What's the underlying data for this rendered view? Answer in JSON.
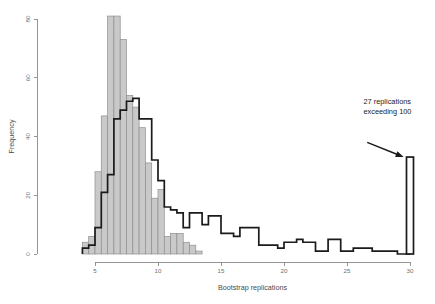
{
  "chart_data": {
    "type": "bar",
    "title": "",
    "xlabel": "Bootstrap replications",
    "ylabel": "Frequency",
    "xlim": [
      3.2,
      30.8
    ],
    "ylim": [
      0,
      84
    ],
    "xticks": [
      5,
      10,
      15,
      20,
      25,
      30
    ],
    "xtick_labels": [
      "5",
      "10",
      "15",
      "20",
      "25",
      "30"
    ],
    "yticks": [
      0,
      20,
      40,
      60,
      80
    ],
    "ytick_labels": [
      "0",
      "20",
      "40",
      "60",
      "80"
    ],
    "grid": false,
    "legend": "none",
    "bin_width": 0.5,
    "series": [
      {
        "name": "gray-histogram",
        "style": "filled-bars",
        "fill_color": "#c9c9c9",
        "edge_color": "#8f8f8f",
        "bins": [
          {
            "x": 4.0,
            "value": 4
          },
          {
            "x": 4.5,
            "value": 6
          },
          {
            "x": 5.0,
            "value": 28
          },
          {
            "x": 5.5,
            "value": 47
          },
          {
            "x": 6.0,
            "value": 81
          },
          {
            "x": 6.5,
            "value": 81
          },
          {
            "x": 7.0,
            "value": 73
          },
          {
            "x": 7.5,
            "value": 54
          },
          {
            "x": 8.0,
            "value": 50
          },
          {
            "x": 8.5,
            "value": 43
          },
          {
            "x": 9.0,
            "value": 31
          },
          {
            "x": 9.5,
            "value": 19
          },
          {
            "x": 10.0,
            "value": 22
          },
          {
            "x": 10.5,
            "value": 6
          },
          {
            "x": 11.0,
            "value": 7
          },
          {
            "x": 11.5,
            "value": 7
          },
          {
            "x": 12.0,
            "value": 4
          },
          {
            "x": 12.5,
            "value": 3
          },
          {
            "x": 13.0,
            "value": 1
          }
        ]
      },
      {
        "name": "outline-histogram",
        "style": "step-outline",
        "edge_color": "#1b1b1b",
        "bins": [
          {
            "x": 4.0,
            "value": 2
          },
          {
            "x": 4.5,
            "value": 3
          },
          {
            "x": 5.0,
            "value": 9
          },
          {
            "x": 5.5,
            "value": 21
          },
          {
            "x": 6.0,
            "value": 27
          },
          {
            "x": 6.5,
            "value": 46
          },
          {
            "x": 7.0,
            "value": 49
          },
          {
            "x": 7.5,
            "value": 52
          },
          {
            "x": 8.0,
            "value": 53
          },
          {
            "x": 8.5,
            "value": 46
          },
          {
            "x": 9.0,
            "value": 46
          },
          {
            "x": 9.5,
            "value": 32
          },
          {
            "x": 10.0,
            "value": 25
          },
          {
            "x": 10.5,
            "value": 16
          },
          {
            "x": 11.0,
            "value": 15
          },
          {
            "x": 11.5,
            "value": 14
          },
          {
            "x": 12.0,
            "value": 9
          },
          {
            "x": 12.5,
            "value": 14
          },
          {
            "x": 13.0,
            "value": 14
          },
          {
            "x": 13.5,
            "value": 10
          },
          {
            "x": 14.0,
            "value": 13
          },
          {
            "x": 14.5,
            "value": 13
          },
          {
            "x": 15.0,
            "value": 7
          },
          {
            "x": 15.5,
            "value": 7
          },
          {
            "x": 16.0,
            "value": 6
          },
          {
            "x": 16.5,
            "value": 9
          },
          {
            "x": 17.0,
            "value": 9
          },
          {
            "x": 17.5,
            "value": 9
          },
          {
            "x": 18.0,
            "value": 3
          },
          {
            "x": 18.5,
            "value": 3
          },
          {
            "x": 19.0,
            "value": 3
          },
          {
            "x": 19.5,
            "value": 2
          },
          {
            "x": 20.0,
            "value": 4
          },
          {
            "x": 20.5,
            "value": 4
          },
          {
            "x": 21.0,
            "value": 5
          },
          {
            "x": 21.5,
            "value": 4
          },
          {
            "x": 22.0,
            "value": 4
          },
          {
            "x": 22.5,
            "value": 1
          },
          {
            "x": 23.0,
            "value": 1
          },
          {
            "x": 23.5,
            "value": 5
          },
          {
            "x": 24.0,
            "value": 5
          },
          {
            "x": 24.5,
            "value": 1
          },
          {
            "x": 25.0,
            "value": 1
          },
          {
            "x": 25.5,
            "value": 2
          },
          {
            "x": 26.0,
            "value": 2
          },
          {
            "x": 26.5,
            "value": 2
          },
          {
            "x": 27.0,
            "value": 1
          },
          {
            "x": 27.5,
            "value": 1
          },
          {
            "x": 28.0,
            "value": 1
          },
          {
            "x": 28.5,
            "value": 1
          },
          {
            "x": 29.0,
            "value": 0
          },
          {
            "x": 29.5,
            "value": 0
          }
        ]
      },
      {
        "name": "overflow-spike",
        "style": "outlined-bar",
        "edge_color": "#1b1b1b",
        "fill_color": "#ffffff",
        "bins": [
          {
            "x": 30.0,
            "value": 33
          }
        ]
      }
    ],
    "annotations": [
      {
        "name": "overflow-note",
        "line1": "27 replications",
        "line2": "exceeding 100",
        "text_x": 26.3,
        "text_y": 51,
        "arrow_from_x": 26.6,
        "arrow_from_y": 38,
        "arrow_to_x": 29.5,
        "arrow_to_y": 33
      }
    ]
  }
}
